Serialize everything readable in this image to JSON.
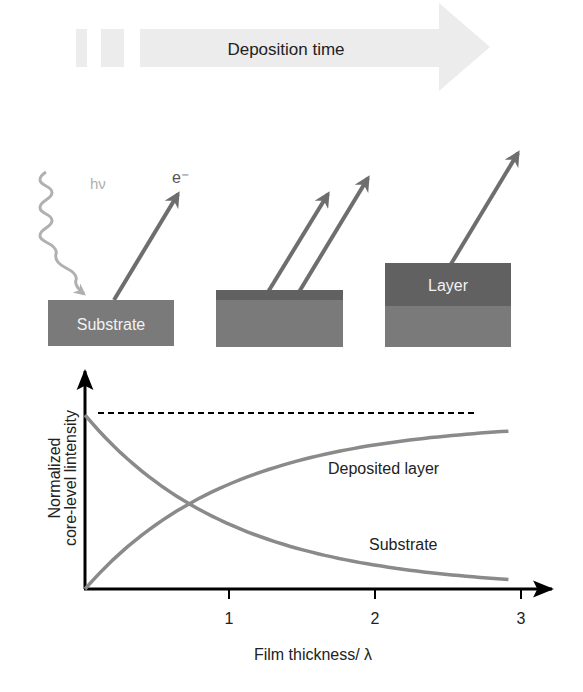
{
  "top_arrow": {
    "label": "Deposition time"
  },
  "panels": [
    {
      "id": "substrate-only",
      "block_label": "Substrate",
      "photon_label": "hν",
      "electron_label": "e⁻"
    },
    {
      "id": "thin-layer"
    },
    {
      "id": "thick-layer",
      "block_label": "Layer"
    }
  ],
  "colors": {
    "arrow_light": "#ececec",
    "photon": "#b0b0b0",
    "electron_arrow": "#6e6e6e",
    "substrate": "#7a7a7a",
    "layer": "#616161",
    "curve": "#8a8a8a",
    "axis": "#000000"
  },
  "chart_data": {
    "type": "line",
    "title": "",
    "xlabel": "Film thickness/ λ",
    "ylabel": "Normalized core-level lintensity",
    "ylabel_lines": [
      "Normalized",
      "core-level lintensity"
    ],
    "x_ticks": [
      "1",
      "2",
      "3"
    ],
    "xlim": [
      0,
      3.1
    ],
    "ylim": [
      0,
      1.1
    ],
    "grid": false,
    "legend": "inline labels",
    "series": [
      {
        "name": "Deposited layer",
        "formula": "1 - exp(-x)",
        "x": [
          0,
          0.5,
          1,
          1.5,
          2,
          2.5,
          2.9
        ],
        "values": [
          0,
          0.39,
          0.63,
          0.78,
          0.86,
          0.92,
          0.94
        ]
      },
      {
        "name": "Substrate",
        "formula": "exp(-x)",
        "x": [
          0,
          0.5,
          1,
          1.5,
          2,
          2.5,
          2.9
        ],
        "values": [
          1.0,
          0.61,
          0.37,
          0.22,
          0.14,
          0.08,
          0.06
        ]
      },
      {
        "name": "Saturation (reference)",
        "style": "dashed",
        "x": [
          0.1,
          2.7
        ],
        "values": [
          1.0,
          1.0
        ]
      }
    ],
    "annotations": [
      "Deposited layer",
      "Substrate"
    ]
  }
}
